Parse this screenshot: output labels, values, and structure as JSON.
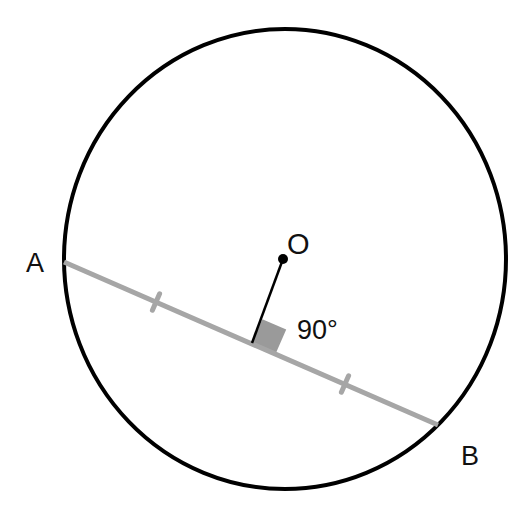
{
  "diagram": {
    "type": "geometry",
    "labels": {
      "point_a": "A",
      "point_b": "B",
      "center": "O",
      "angle": "90°"
    },
    "colors": {
      "circle": "#000000",
      "chord": "#a6a6a6",
      "tick": "#a6a6a6",
      "perpendicular": "#000000",
      "right_angle_marker": "#9a9a9a",
      "center_dot": "#000000",
      "background": "#ffffff"
    },
    "geometry": {
      "circle": {
        "cx": 285,
        "cy": 259,
        "rx": 221,
        "ry": 230
      },
      "chord": {
        "x1": 64,
        "y1": 262,
        "x2": 438,
        "y2": 425
      },
      "center_point": {
        "x": 283,
        "y": 259
      },
      "perpendicular_foot": {
        "x": 252,
        "y": 343
      },
      "equal_length_ticks": [
        {
          "x": 156,
          "y": 302
        },
        {
          "x": 345,
          "y": 384
        }
      ]
    }
  }
}
